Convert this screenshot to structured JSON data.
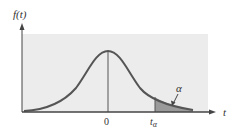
{
  "diagram": {
    "y_axis_label": "f(t)",
    "x_axis_label": "t",
    "center_tick_label": "0",
    "critical_value_label": "t",
    "critical_value_subscript": "α",
    "tail_area_label": "α",
    "colors": {
      "panel": "#ececec",
      "curve": "#555555",
      "shade": "#9a9a9a",
      "axis": "#444444"
    }
  }
}
